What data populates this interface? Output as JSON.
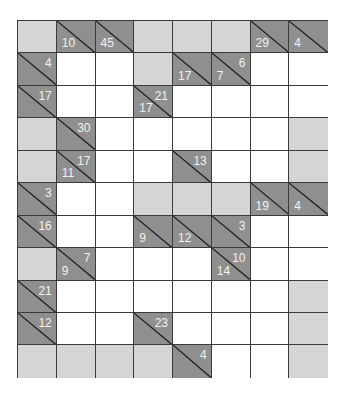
{
  "puzzle": {
    "type": "kakuro",
    "cols": 8,
    "rows": 11,
    "colors": {
      "blank": "#d5d5d5",
      "clue": "#8f8f8f",
      "white": "#ffffff",
      "grid_line": "#3a3a3a",
      "clue_text": "#f2f2f2"
    },
    "grid": [
      [
        {
          "t": "b"
        },
        {
          "t": "c",
          "d": "10"
        },
        {
          "t": "c",
          "d": "45"
        },
        {
          "t": "b"
        },
        {
          "t": "b"
        },
        {
          "t": "b"
        },
        {
          "t": "c",
          "d": "29"
        },
        {
          "t": "c",
          "d": "4"
        }
      ],
      [
        {
          "t": "c",
          "r": "4"
        },
        {
          "t": "w"
        },
        {
          "t": "w"
        },
        {
          "t": "b"
        },
        {
          "t": "c",
          "d": "17"
        },
        {
          "t": "c",
          "d": "7",
          "r": "6"
        },
        {
          "t": "w"
        },
        {
          "t": "w"
        }
      ],
      [
        {
          "t": "c",
          "r": "17"
        },
        {
          "t": "w"
        },
        {
          "t": "w"
        },
        {
          "t": "c",
          "d": "17",
          "r": "21"
        },
        {
          "t": "w"
        },
        {
          "t": "w"
        },
        {
          "t": "w"
        },
        {
          "t": "w"
        }
      ],
      [
        {
          "t": "b"
        },
        {
          "t": "c",
          "r": "30"
        },
        {
          "t": "w"
        },
        {
          "t": "w"
        },
        {
          "t": "w"
        },
        {
          "t": "w"
        },
        {
          "t": "w"
        },
        {
          "t": "b"
        }
      ],
      [
        {
          "t": "b"
        },
        {
          "t": "c",
          "d": "11",
          "r": "17"
        },
        {
          "t": "w"
        },
        {
          "t": "w"
        },
        {
          "t": "c",
          "r": "13"
        },
        {
          "t": "w"
        },
        {
          "t": "w"
        },
        {
          "t": "b"
        }
      ],
      [
        {
          "t": "c",
          "r": "3"
        },
        {
          "t": "w"
        },
        {
          "t": "w"
        },
        {
          "t": "b"
        },
        {
          "t": "b"
        },
        {
          "t": "b"
        },
        {
          "t": "c",
          "d": "19"
        },
        {
          "t": "c",
          "d": "4"
        }
      ],
      [
        {
          "t": "c",
          "r": "16"
        },
        {
          "t": "w"
        },
        {
          "t": "w"
        },
        {
          "t": "c",
          "d": "9"
        },
        {
          "t": "c",
          "d": "12"
        },
        {
          "t": "c",
          "r": "3"
        },
        {
          "t": "w"
        },
        {
          "t": "w"
        }
      ],
      [
        {
          "t": "b"
        },
        {
          "t": "c",
          "d": "9",
          "r": "7"
        },
        {
          "t": "w"
        },
        {
          "t": "w"
        },
        {
          "t": "w"
        },
        {
          "t": "c",
          "d": "14",
          "r": "10"
        },
        {
          "t": "w"
        },
        {
          "t": "w"
        }
      ],
      [
        {
          "t": "c",
          "r": "21"
        },
        {
          "t": "w"
        },
        {
          "t": "w"
        },
        {
          "t": "w"
        },
        {
          "t": "w"
        },
        {
          "t": "w"
        },
        {
          "t": "w"
        },
        {
          "t": "b"
        }
      ],
      [
        {
          "t": "c",
          "r": "12"
        },
        {
          "t": "w"
        },
        {
          "t": "w"
        },
        {
          "t": "c",
          "r": "23"
        },
        {
          "t": "w"
        },
        {
          "t": "w"
        },
        {
          "t": "w"
        },
        {
          "t": "b"
        }
      ],
      [
        {
          "t": "b"
        },
        {
          "t": "b"
        },
        {
          "t": "b"
        },
        {
          "t": "b"
        },
        {
          "t": "c",
          "r": "4"
        },
        {
          "t": "w"
        },
        {
          "t": "w"
        },
        {
          "t": "b"
        }
      ]
    ]
  }
}
